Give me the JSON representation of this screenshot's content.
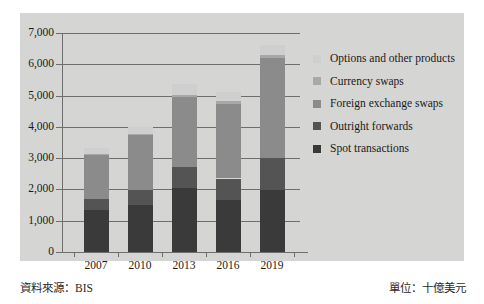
{
  "footer": {
    "source": "資料來源：BIS",
    "unit": "單位：十億美元"
  },
  "chart_data": {
    "type": "bar",
    "subtype": "stacked-bar",
    "title": "",
    "xlabel": "",
    "ylabel": "",
    "categories": [
      "2007",
      "2010",
      "2013",
      "2016",
      "2019"
    ],
    "ylim": [
      0,
      7000
    ],
    "yticks": [
      0,
      1000,
      2000,
      3000,
      4000,
      5000,
      6000,
      7000
    ],
    "ytick_labels": [
      "0",
      "1,000",
      "2,000",
      "3,000",
      "4,000",
      "5,000",
      "6,000",
      "7,000"
    ],
    "grid": true,
    "legend_position": "right",
    "series": [
      {
        "name": "Spot transactions",
        "color": "#3a3a3a",
        "values": [
          1330,
          1490,
          2050,
          1650,
          1990
        ]
      },
      {
        "name": "Outright forwards",
        "color": "#545454",
        "values": [
          360,
          480,
          680,
          700,
          1000
        ]
      },
      {
        "name": "Foreign exchange swaps",
        "color": "#8b8b8b",
        "values": [
          1420,
          1760,
          2230,
          2380,
          3200
        ]
      },
      {
        "name": "Currency swaps",
        "color": "#a8a8a8",
        "values": [
          30,
          45,
          55,
          90,
          110
        ]
      },
      {
        "name": "Options and other products",
        "color": "#cfcfcf",
        "values": [
          180,
          210,
          340,
          290,
          310
        ]
      }
    ],
    "totals": [
      3320,
      3985,
      5355,
      5110,
      6610
    ],
    "legend_entries": [
      "Options and other products",
      "Currency swaps",
      "Foreign exchange swaps",
      "Outright forwards",
      "Spot transactions"
    ]
  },
  "colors": {
    "panel_bg": "#d5d5d3",
    "axis": "#6e6e6e",
    "text": "#1a1a1a"
  }
}
